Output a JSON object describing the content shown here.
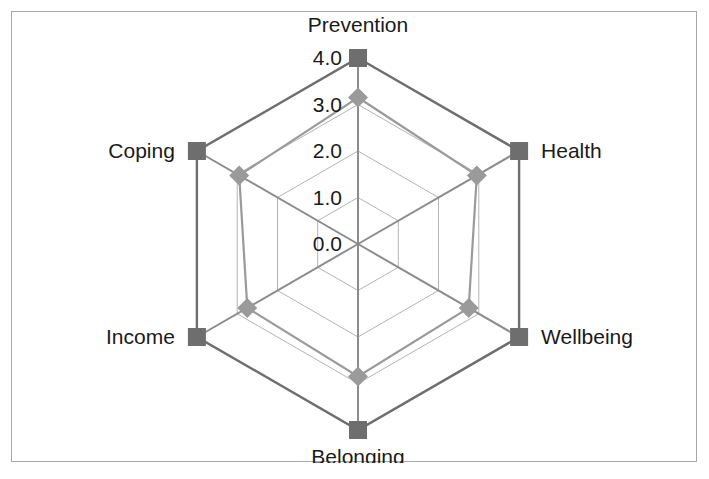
{
  "chart_data": {
    "type": "radar",
    "title": "",
    "categories": [
      "Prevention",
      "Health",
      "Wellbeing",
      "Belonging",
      "Income",
      "Coping"
    ],
    "tick_labels": [
      "0.0",
      "1.0",
      "2.0",
      "3.0",
      "4.0"
    ],
    "ticks": [
      0,
      1,
      2,
      3,
      4
    ],
    "rlim": [
      0,
      4
    ],
    "grid": true,
    "legend": "none",
    "series": [
      {
        "name": "outer",
        "marker": "square",
        "color": "#6e6e6e",
        "values": [
          4.0,
          4.0,
          4.0,
          4.0,
          4.0,
          4.0
        ]
      },
      {
        "name": "inner",
        "marker": "diamond",
        "color": "#9a9a9a",
        "values": [
          3.15,
          2.95,
          2.75,
          2.85,
          2.75,
          2.95
        ]
      }
    ],
    "colors": {
      "outer_series": "#6e6e6e",
      "inner_series": "#9a9a9a",
      "grid": "#b4b4b4",
      "spoke": "#8c8c8c",
      "text": "#1a1a1a",
      "frame": "#a8a8a8",
      "background": "#ffffff"
    },
    "geometry": {
      "center_x": 357,
      "center_y": 243,
      "radius_max": 186,
      "start_angle_deg": -90
    }
  },
  "labels": {
    "prevention": "Prevention",
    "health": "Health",
    "wellbeing": "Wellbeing",
    "belonging": "Belonging",
    "income": "Income",
    "coping": "Coping"
  },
  "ticks": {
    "t0": "0.0",
    "t1": "1.0",
    "t2": "2.0",
    "t3": "3.0",
    "t4": "4.0"
  }
}
